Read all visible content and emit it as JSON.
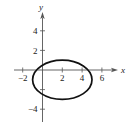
{
  "chart_data": {
    "type": "line",
    "title": "",
    "xlabel": "x",
    "ylabel": "y",
    "xlim": [
      -2.5,
      7.5
    ],
    "ylim": [
      -5,
      6
    ],
    "x_ticks": [
      -2,
      2,
      4,
      6
    ],
    "x_tick_labels": [
      "-2",
      "2",
      "4",
      "6"
    ],
    "x_unlabeled_ticks": [],
    "y_ticks": [
      4,
      2,
      -2,
      -4
    ],
    "y_tick_labels": [
      "4",
      "2",
      "",
      "-4"
    ],
    "grid": false,
    "legend": null,
    "series": [
      {
        "name": "ellipse",
        "shape": "ellipse",
        "center": [
          2,
          -1
        ],
        "semi_axis_x": 3,
        "semi_axis_y": 2,
        "equation": "(x-2)^2/9 + (y+1)^2/4 = 1",
        "color": "#111111"
      }
    ]
  },
  "axes": {
    "x_label": "x",
    "y_label": "y",
    "color": "#555555"
  }
}
